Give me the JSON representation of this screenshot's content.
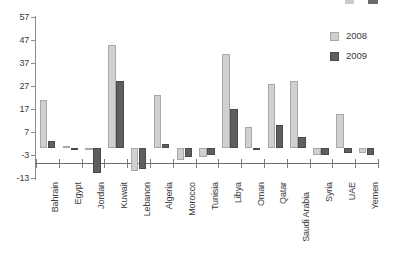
{
  "chart_data": {
    "type": "bar",
    "title": "",
    "subtitle": "",
    "xlabel": "",
    "ylabel": "",
    "ylim": [
      -13,
      57
    ],
    "ytick_values": [
      57,
      47,
      37,
      27,
      17,
      7,
      -3,
      -13
    ],
    "ytick_labels": [
      "57",
      "47",
      "37",
      "27",
      "17",
      "7",
      "-3",
      "-13"
    ],
    "grid": false,
    "legend_position": "top-right",
    "categories": [
      "Bahrain",
      "Egypt",
      "Jordan",
      "Kuwait",
      "Lebanon",
      "Algeria",
      "Morocco",
      "Tunisia",
      "Libya",
      "Oman",
      "Qatar",
      "Saudi Arabia",
      "Syria",
      "UAE",
      "Yemen"
    ],
    "series": [
      {
        "name": "2008",
        "color": "#d0d0d0",
        "values": [
          21,
          1,
          -1,
          45,
          -10,
          23,
          -5,
          -4,
          41,
          9,
          28,
          29,
          -3,
          15,
          -2
        ]
      },
      {
        "name": "2009",
        "color": "#5f5f5f",
        "values": [
          3,
          -1,
          -11,
          29,
          -9,
          2,
          -4,
          -3,
          17,
          0,
          10,
          5,
          -3,
          -2,
          -3
        ]
      }
    ]
  },
  "legend": {
    "items": [
      {
        "label": "2008",
        "color": "#d0d0d0"
      },
      {
        "label": "2009",
        "color": "#5f5f5f"
      }
    ]
  }
}
